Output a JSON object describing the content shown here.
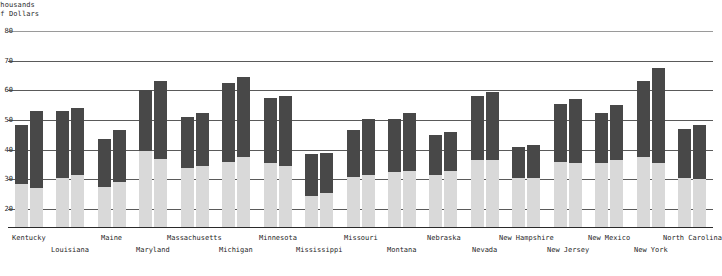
{
  "axis": {
    "y_title_line1": "Thousands",
    "y_title_line2": "of Dollars",
    "y_ticks": [
      "80",
      "70",
      "60",
      "50",
      "40",
      "30",
      "20"
    ]
  },
  "colors": {
    "dark_bar": "#484848",
    "light_bar": "#d9d9d9",
    "gridline": "#5a5a5a",
    "background": "#ffffff"
  },
  "chart_data": {
    "type": "bar",
    "title": "",
    "subtitle": "",
    "xlabel": "",
    "ylabel": "Thousands of Dollars",
    "ylim": [
      20,
      80
    ],
    "grid": true,
    "legend_position": "none",
    "note": "Each state shows two stacked range bars: a light gray lower segment from the axis baseline up to the series low value, and a dark upper segment spanning from the low value to the high value.",
    "categories": [
      "Kentucky",
      "Louisiana",
      "Maine",
      "Maryland",
      "Massachusetts",
      "Michigan",
      "Minnesota",
      "Mississippi",
      "Missouri",
      "Montana",
      "Nebraska",
      "Nevada",
      "New Hampshire",
      "New Jersey",
      "New Mexico",
      "New York",
      "North Carolina"
    ],
    "series": [
      {
        "name": "Bar A low",
        "values": [
          28.5,
          30.5,
          27.5,
          39.5,
          34.0,
          36.0,
          35.5,
          24.5,
          31.0,
          32.5,
          31.5,
          36.5,
          30.5,
          36.0,
          35.5,
          37.5,
          30.5
        ]
      },
      {
        "name": "Bar A high",
        "values": [
          48.5,
          53.0,
          43.5,
          60.0,
          51.0,
          62.5,
          57.5,
          38.5,
          46.5,
          50.5,
          45.0,
          58.0,
          41.0,
          55.5,
          52.5,
          63.0,
          47.0
        ]
      },
      {
        "name": "Bar B low",
        "values": [
          27.0,
          31.5,
          29.0,
          37.0,
          34.5,
          37.5,
          34.5,
          25.5,
          31.5,
          33.0,
          33.0,
          36.5,
          30.5,
          35.5,
          36.5,
          35.5,
          30.0
        ]
      },
      {
        "name": "Bar B high",
        "values": [
          53.0,
          54.0,
          46.5,
          63.0,
          52.5,
          64.5,
          58.0,
          39.0,
          50.5,
          52.5,
          46.0,
          59.5,
          41.5,
          57.0,
          55.0,
          67.5,
          48.5
        ]
      }
    ]
  },
  "x_axis_labels": [
    {
      "label": "Kentucky",
      "row": 0
    },
    {
      "label": "Louisiana",
      "row": 1
    },
    {
      "label": "Maine",
      "row": 0
    },
    {
      "label": "Maryland",
      "row": 1
    },
    {
      "label": "Massachusetts",
      "row": 0
    },
    {
      "label": "Michigan",
      "row": 1
    },
    {
      "label": "Minnesota",
      "row": 0
    },
    {
      "label": "Mississippi",
      "row": 1
    },
    {
      "label": "Missouri",
      "row": 0
    },
    {
      "label": "Montana",
      "row": 1
    },
    {
      "label": "Nebraska",
      "row": 0
    },
    {
      "label": "Nevada",
      "row": 1
    },
    {
      "label": "New Hampshire",
      "row": 0
    },
    {
      "label": "New Jersey",
      "row": 1
    },
    {
      "label": "New Mexico",
      "row": 0
    },
    {
      "label": "New York",
      "row": 1
    },
    {
      "label": "North Carolina",
      "row": 0
    }
  ]
}
